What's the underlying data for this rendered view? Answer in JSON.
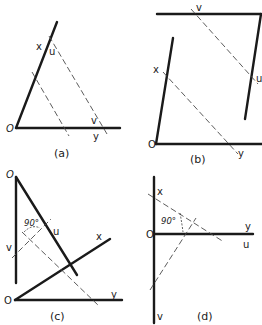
{
  "figure": {
    "colors": {
      "ink": "#1a1a1a",
      "dash": "#4a4a4a",
      "background": "#ffffff"
    },
    "panels": [
      {
        "id": "a",
        "caption": "(a)",
        "labels": {
          "origin": "O",
          "x": "x",
          "u": "u",
          "v": "v",
          "y": "y"
        }
      },
      {
        "id": "b",
        "caption": "(b)",
        "labels": {
          "origin": "O",
          "x": "x",
          "u": "u",
          "v": "v",
          "y": "y"
        }
      },
      {
        "id": "c",
        "caption": "(c)",
        "labels": {
          "origin_top": "O",
          "origin_bottom": "O",
          "x": "x",
          "u": "u",
          "v": "v",
          "y": "y",
          "angle": "90°"
        }
      },
      {
        "id": "d",
        "caption": "(d)",
        "labels": {
          "origin": "O",
          "x": "x",
          "u": "u",
          "v": "v",
          "y": "y",
          "angle": "90°"
        }
      }
    ]
  }
}
